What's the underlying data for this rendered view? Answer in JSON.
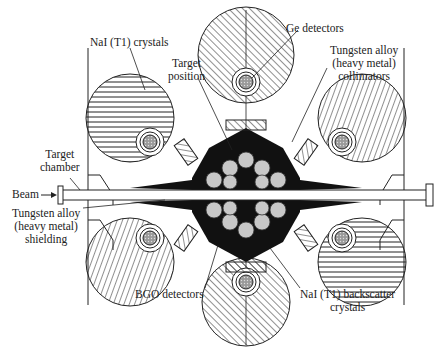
{
  "diagram": {
    "type": "detector-array-cross-section",
    "colors": {
      "line": "#222222",
      "fill_dark": "#111111",
      "crystal_core": "#b0b0b0",
      "background": "#ffffff"
    }
  },
  "labels": {
    "nai_crystals": "NaI (T1) crystals",
    "ge_detectors": "Ge detectors",
    "target_position_1": "Target",
    "target_position_2": "position",
    "collimators_1": "Tungsten alloy",
    "collimators_2": "(heavy metal)",
    "collimators_3": "collimators",
    "target_chamber_1": "Target",
    "target_chamber_2": "chamber",
    "beam": "Beam",
    "shielding_1": "Tungsten alloy",
    "shielding_2": "(heavy metal)",
    "shielding_3": "shielding",
    "bgo": "BGO detectors",
    "backscatter_1": "NaI (T1) backscatter",
    "backscatter_2": "crystals"
  }
}
